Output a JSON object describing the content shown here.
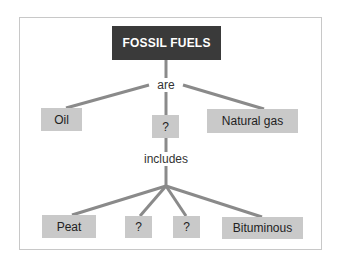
{
  "diagram": {
    "title": "FOSSIL FUELS",
    "link_labels": {
      "are": "are",
      "includes": "includes"
    },
    "level1": [
      {
        "label": "Oil"
      },
      {
        "label": "?"
      },
      {
        "label": "Natural gas"
      }
    ],
    "level2": [
      {
        "label": "Peat"
      },
      {
        "label": "?"
      },
      {
        "label": "?"
      },
      {
        "label": "Bituminous"
      }
    ],
    "colors": {
      "title_box": "#3a3a3a",
      "title_text": "#ffffff",
      "node_box": "#c9c9c9",
      "connector": "#8a8a8a",
      "frame": "#c8c8c8"
    }
  }
}
